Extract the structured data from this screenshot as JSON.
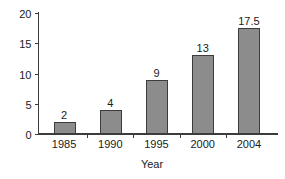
{
  "chart_data": {
    "type": "bar",
    "title": "",
    "subtitle": "",
    "categories": [
      "1985",
      "1990",
      "1995",
      "2000",
      "2004"
    ],
    "values": [
      2,
      4,
      9,
      13,
      17.5
    ],
    "value_labels": [
      "2",
      "4",
      "9",
      "13",
      "17.5"
    ],
    "xlabel": "Year",
    "ylabel": "",
    "ylim": [
      0,
      20
    ],
    "yticks": [
      0,
      5,
      10,
      15,
      20
    ],
    "ytick_labels": [
      "0",
      "5",
      "10",
      "15",
      "20"
    ],
    "grid": false,
    "legend": false,
    "legend_position": "none",
    "bar_fill_color": "#8c8c8c",
    "bar_border_color": "#3c3c3c",
    "axis_color": "#3c3c3c",
    "background_color": "#ffffff",
    "text_color": "#1a1a1a"
  },
  "axes": {
    "x_title": "Year",
    "y_title": ""
  }
}
